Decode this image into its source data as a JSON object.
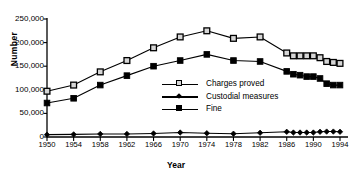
{
  "chart_data": {
    "type": "line",
    "title": "",
    "xlabel": "Year",
    "ylabel": "Number",
    "xlim": [
      1950,
      1994
    ],
    "ylim": [
      0,
      250000
    ],
    "ytick_labels": [
      "250,000",
      "200,000",
      "150,000",
      "100,000",
      "50,000",
      "0"
    ],
    "ytick_values": [
      250000,
      200000,
      150000,
      100000,
      50000,
      0
    ],
    "xtick_labels": [
      "1950",
      "1954",
      "1958",
      "1962",
      "1966",
      "1970",
      "1974",
      "1978",
      "1982",
      "1986",
      "1990",
      "1994"
    ],
    "xtick_values": [
      1950,
      1954,
      1958,
      1962,
      1966,
      1970,
      1974,
      1978,
      1982,
      1986,
      1990,
      1994
    ],
    "grid": false,
    "legend_position": "center",
    "x": [
      1950,
      1954,
      1958,
      1962,
      1966,
      1970,
      1974,
      1978,
      1982,
      1986,
      1987,
      1988,
      1989,
      1990,
      1991,
      1992,
      1993,
      1994
    ],
    "series": [
      {
        "name": "Charges proved",
        "marker": "open-square",
        "values": [
          97000,
          110000,
          138000,
          162000,
          189000,
          212000,
          225000,
          209000,
          212000,
          178000,
          172000,
          172000,
          172000,
          172000,
          168000,
          160000,
          158000,
          156000
        ]
      },
      {
        "name": "Custodial measures",
        "marker": "filled-diamond",
        "values": [
          5000,
          5500,
          6500,
          6500,
          7500,
          9500,
          8000,
          7000,
          9000,
          11000,
          9500,
          9500,
          9500,
          9500,
          11000,
          11500,
          11500,
          11000
        ]
      },
      {
        "name": "Fine",
        "marker": "filled-square",
        "values": [
          72000,
          82000,
          110000,
          130000,
          150000,
          162000,
          175000,
          162000,
          160000,
          139000,
          133000,
          131000,
          128000,
          128000,
          124000,
          113000,
          110000,
          110000
        ]
      }
    ]
  },
  "legend": {
    "items": [
      {
        "label": "Charges proved",
        "marker": "open-square"
      },
      {
        "label": "Custodial measures",
        "marker": "filled-diamond"
      },
      {
        "label": "Fine",
        "marker": "filled-square"
      }
    ]
  }
}
